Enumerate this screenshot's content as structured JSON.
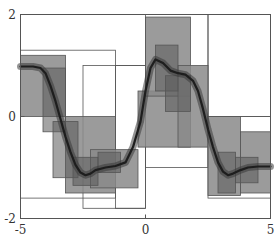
{
  "chart_data": {
    "type": "area",
    "title": "",
    "xlabel": "",
    "ylabel": "",
    "xlim": [
      -5,
      5
    ],
    "ylim": [
      -2,
      2
    ],
    "grid": false,
    "legend": null,
    "x_ticks": [
      -5,
      0,
      5
    ],
    "y_ticks": [
      -2,
      0,
      2
    ],
    "x_tick_labels": [
      "-5",
      "0",
      "5"
    ],
    "y_tick_labels": [
      "-2",
      "0",
      "2"
    ],
    "curve": {
      "name": "estimate",
      "x": [
        -5,
        -4.5,
        -4.2,
        -4.0,
        -3.8,
        -3.6,
        -3.4,
        -3.2,
        -3.0,
        -2.8,
        -2.6,
        -2.4,
        -2.2,
        -2.0,
        -1.6,
        -1.2,
        -0.8,
        -0.5,
        -0.2,
        0.0,
        0.2,
        0.4,
        0.7,
        1.0,
        1.3,
        1.6,
        1.9,
        2.1,
        2.3,
        2.5,
        2.7,
        2.9,
        3.1,
        3.3,
        3.5,
        3.8,
        4.1,
        4.5,
        5.0
      ],
      "y": [
        0.98,
        0.98,
        0.95,
        0.85,
        0.6,
        0.3,
        -0.05,
        -0.4,
        -0.7,
        -0.95,
        -1.1,
        -1.15,
        -1.12,
        -1.05,
        -1.0,
        -0.97,
        -0.9,
        -0.6,
        -0.1,
        0.5,
        0.95,
        1.12,
        1.05,
        0.9,
        0.85,
        0.82,
        0.7,
        0.5,
        0.15,
        -0.25,
        -0.6,
        -0.9,
        -1.08,
        -1.15,
        -1.12,
        -1.05,
        -1.0,
        -0.98,
        -0.98
      ]
    },
    "boxes": {
      "outline": [
        {
          "x0": -5.0,
          "x1": -1.2,
          "y0": -1.6,
          "y1": 1.3
        },
        {
          "x0": -1.2,
          "x1": 0.0,
          "y0": -1.8,
          "y1": 1.0
        },
        {
          "x0": -2.5,
          "x1": 0.0,
          "y0": -1.8,
          "y1": 1.0
        },
        {
          "x0": 0.0,
          "x1": 2.5,
          "y0": -1.0,
          "y1": 2.0
        },
        {
          "x0": 2.5,
          "x1": 5.0,
          "y0": 0.0,
          "y1": 2.0
        },
        {
          "x0": 2.5,
          "x1": 5.0,
          "y0": -1.6,
          "y1": 0.0
        }
      ],
      "level1": [
        {
          "x0": -5.0,
          "x1": -3.2,
          "y0": 0.0,
          "y1": 1.2
        },
        {
          "x0": -3.2,
          "x1": -1.2,
          "y0": -1.5,
          "y1": 0.0
        },
        {
          "x0": -2.2,
          "x1": -0.3,
          "y0": -1.4,
          "y1": -0.65
        },
        {
          "x0": -0.3,
          "x1": 1.8,
          "y0": -0.6,
          "y1": 0.5
        },
        {
          "x0": 0.0,
          "x1": 1.8,
          "y0": 0.4,
          "y1": 1.95
        },
        {
          "x0": 1.3,
          "x1": 2.5,
          "y0": -0.6,
          "y1": 1.0
        },
        {
          "x0": 2.5,
          "x1": 3.8,
          "y0": -1.55,
          "y1": 0.0
        },
        {
          "x0": 3.8,
          "x1": 5.0,
          "y0": -1.5,
          "y1": -0.3
        }
      ],
      "level2": [
        {
          "x0": -4.1,
          "x1": -3.2,
          "y0": -0.3,
          "y1": 0.95
        },
        {
          "x0": -3.7,
          "x1": -2.7,
          "y0": -1.2,
          "y1": -0.1
        },
        {
          "x0": -2.9,
          "x1": -1.9,
          "y0": -1.35,
          "y1": -0.8
        },
        {
          "x0": -1.9,
          "x1": -1.0,
          "y0": -1.1,
          "y1": -0.7
        },
        {
          "x0": 0.4,
          "x1": 1.3,
          "y0": 0.5,
          "y1": 1.4
        },
        {
          "x0": 0.8,
          "x1": 1.8,
          "y0": 0.1,
          "y1": 0.8
        },
        {
          "x0": 2.9,
          "x1": 3.6,
          "y0": -1.5,
          "y1": -0.7
        },
        {
          "x0": 3.6,
          "x1": 4.5,
          "y0": -1.3,
          "y1": -0.8
        }
      ]
    },
    "colors": {
      "frame": "#555555",
      "box_fill": "#8a8a8a",
      "box_stroke": "#555555",
      "curve": "#1e1e1e"
    }
  }
}
